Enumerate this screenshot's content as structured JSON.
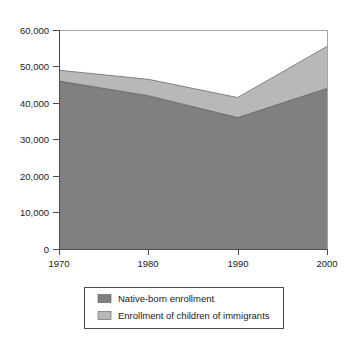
{
  "chart_data": {
    "type": "area",
    "stacked": true,
    "title": "",
    "subtitle": "",
    "xlabel": "",
    "ylabel": "",
    "x": [
      1970,
      1980,
      1990,
      2000
    ],
    "categories": [
      "1970",
      "1980",
      "1990",
      "2000"
    ],
    "xtick_labels": [
      "1970",
      "1980",
      "1990",
      "2000"
    ],
    "ytick_labels": [
      "0",
      "10,000",
      "20,000",
      "30,000",
      "40,000",
      "50,000",
      "60,000"
    ],
    "ytick_values": [
      0,
      10000,
      20000,
      30000,
      40000,
      50000,
      60000
    ],
    "xlim": [
      1970,
      2000
    ],
    "ylim": [
      0,
      60000
    ],
    "grid": false,
    "legend_position": "bottom",
    "series": [
      {
        "name": "Native-born enrollment",
        "color": "#808080",
        "values": [
          46000,
          42000,
          36000,
          44000
        ]
      },
      {
        "name": "Enrollment of children of immigrants",
        "color": "#b8b8b8",
        "values": [
          3000,
          4500,
          5500,
          11500
        ]
      }
    ],
    "totals": [
      49000,
      46500,
      41500,
      55500
    ]
  },
  "legend": {
    "items": [
      {
        "label": "Native-born enrollment",
        "color": "#808080"
      },
      {
        "label": "Enrollment of children of immigrants",
        "color": "#b8b8b8"
      }
    ]
  },
  "axes": {
    "y": {
      "labels": [
        "60,000",
        "50,000",
        "40,000",
        "30,000",
        "20,000",
        "10,000",
        "0"
      ]
    },
    "x": {
      "labels": [
        "1970",
        "1980",
        "1990",
        "2000"
      ]
    }
  }
}
